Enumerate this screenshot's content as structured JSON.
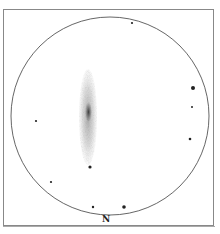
{
  "sketch": {
    "type": "eyepiece-sketch",
    "orientation_label": "N",
    "field_circle": {
      "cx": 110,
      "cy": 116,
      "r": 99,
      "stroke": "#555555"
    },
    "galaxy": {
      "cx": 88,
      "cy": 117,
      "rx": 9,
      "ry": 48,
      "core_rx": 3.5,
      "core_ry": 10,
      "color": "#333333"
    },
    "stars": [
      {
        "x": 132,
        "y": 23,
        "r": 1.1
      },
      {
        "x": 193,
        "y": 88,
        "r": 2.0
      },
      {
        "x": 192,
        "y": 107,
        "r": 1.0
      },
      {
        "x": 190,
        "y": 139,
        "r": 1.3
      },
      {
        "x": 36,
        "y": 121,
        "r": 1.1
      },
      {
        "x": 90,
        "y": 167,
        "r": 1.6
      },
      {
        "x": 51,
        "y": 182,
        "r": 1.1
      },
      {
        "x": 93,
        "y": 207,
        "r": 1.2
      },
      {
        "x": 124,
        "y": 207,
        "r": 1.8
      }
    ]
  }
}
